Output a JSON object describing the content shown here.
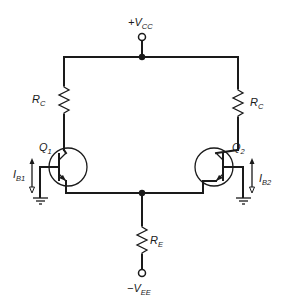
{
  "diagram": {
    "type": "differential-amplifier-schematic",
    "supply_positive": {
      "label": "+V",
      "subscript": "CC"
    },
    "supply_negative": {
      "label": "−V",
      "subscript": "EE"
    },
    "resistors": [
      {
        "id": "rc-left",
        "label": "R",
        "subscript": "C"
      },
      {
        "id": "rc-right",
        "label": "R",
        "subscript": "C"
      },
      {
        "id": "re",
        "label": "R",
        "subscript": "E"
      }
    ],
    "transistors": [
      {
        "id": "q1",
        "label": "Q",
        "subscript": "1",
        "type": "npn"
      },
      {
        "id": "q2",
        "label": "Q",
        "subscript": "2",
        "type": "npn"
      }
    ],
    "currents": [
      {
        "id": "ib1",
        "label": "I",
        "subscript": "B1"
      },
      {
        "id": "ib2",
        "label": "I",
        "subscript": "B2"
      }
    ],
    "grounds": 2,
    "colors": {
      "line": "#1a1a1a",
      "background": "#ffffff"
    }
  }
}
